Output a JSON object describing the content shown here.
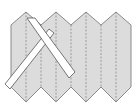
{
  "diagram": {
    "type": "accordion-folded-paper-with-crossed-ribbons",
    "colors": {
      "background": "#ffffff",
      "paper_fill": "#dcdcdc",
      "paper_outline": "#8a8a8a",
      "fold_line": "#8a8a8a",
      "ribbon_fill": "#ffffff",
      "ribbon_outline": "#555555"
    },
    "paper": {
      "outline_points": "11,25 26,12 41,25 56,12 71,25 86,12 101,25 116,12 131,25 131,87 116,102 101,87 86,102 71,87 56,102 41,87 26,102 11,87",
      "fold_lines_x": [
        26,
        41,
        56,
        71,
        86,
        101,
        116
      ],
      "fold_top_y": [
        12,
        25,
        12,
        25,
        12,
        25,
        12
      ],
      "fold_bottom_y": [
        102,
        87,
        102,
        87,
        102,
        87,
        102
      ]
    },
    "ribbons": [
      {
        "name": "ribbon-back",
        "points": "49,29 54,33 10,89 5,84"
      },
      {
        "name": "ribbon-front",
        "points": "27,18 35,18 75,72 69,78"
      }
    ]
  }
}
